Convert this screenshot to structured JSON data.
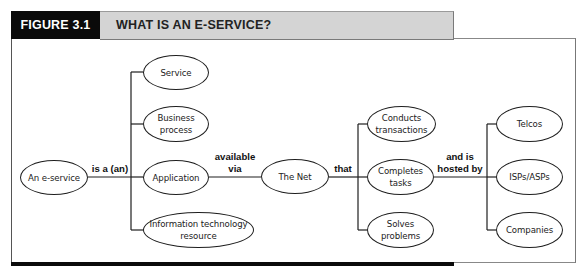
{
  "figure": {
    "number_label": "FIGURE 3.1",
    "title": "WHAT IS AN E-SERVICE?"
  },
  "nodes": {
    "e_service": "An e-service",
    "service": "Service",
    "business_process": "Business\nprocess",
    "application": "Application",
    "it_resource": "Information technology\nresource",
    "the_net": "The Net",
    "conducts_transactions": "Conducts\ntransactions",
    "completes_tasks": "Completes\ntasks",
    "solves_problems": "Solves\nproblems",
    "telcos": "Telcos",
    "isps_asps": "ISPs/ASPs",
    "companies": "Companies"
  },
  "relations": {
    "is_a": "is a (an)",
    "available_via": "available\nvia",
    "that": "that",
    "hosted_by": "and is\nhosted by"
  },
  "colors": {
    "header_black": "#0a0a0a",
    "header_gray": "#d4d4d4",
    "line": "#1e1e1e"
  }
}
